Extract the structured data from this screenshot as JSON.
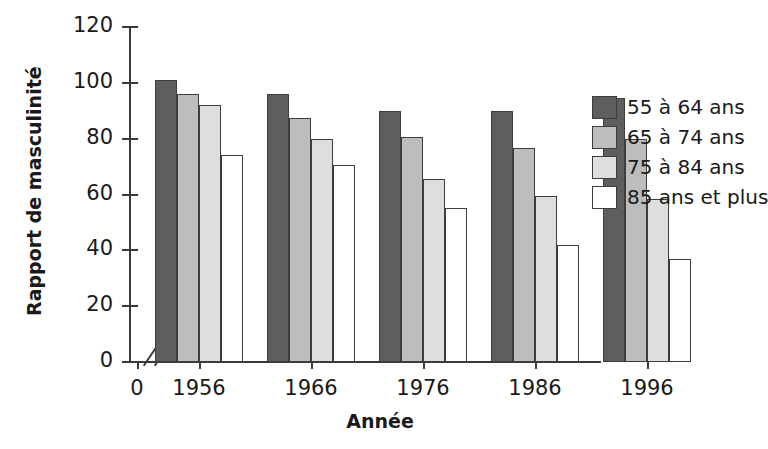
{
  "chart_data": {
    "type": "bar",
    "title": "",
    "subtitle": "",
    "xlabel": "Année",
    "ylabel": "Rapport de masculinité",
    "categories": [
      "1956",
      "1966",
      "1976",
      "1986",
      "1996"
    ],
    "series": [
      {
        "name": "55 à 64 ans",
        "values": [
          101,
          96,
          90,
          90,
          94.5
        ],
        "color": "#5e5e5e"
      },
      {
        "name": "65 à 74 ans",
        "values": [
          96,
          87.5,
          80.5,
          76.5,
          80
        ],
        "color": "#bdbdbd"
      },
      {
        "name": "75 à 84 ans",
        "values": [
          92,
          80,
          65.5,
          59.5,
          58.5
        ],
        "color": "#dedede"
      },
      {
        "name": "85 ans et plus",
        "values": [
          74,
          70.5,
          55,
          42,
          37
        ],
        "color": "#ffffff"
      }
    ],
    "ylim": [
      0,
      120
    ],
    "yticks": [
      0,
      20,
      40,
      60,
      80,
      100,
      120
    ],
    "ytick_labels": [
      "0",
      "20",
      "40",
      "60",
      "80",
      "100",
      "120"
    ],
    "xtick_labels": [
      "0",
      "1956",
      "1966",
      "1976",
      "1986",
      "1996"
    ],
    "origin_label": "0",
    "axis_break": "//",
    "grid": false,
    "legend_position": "right"
  }
}
